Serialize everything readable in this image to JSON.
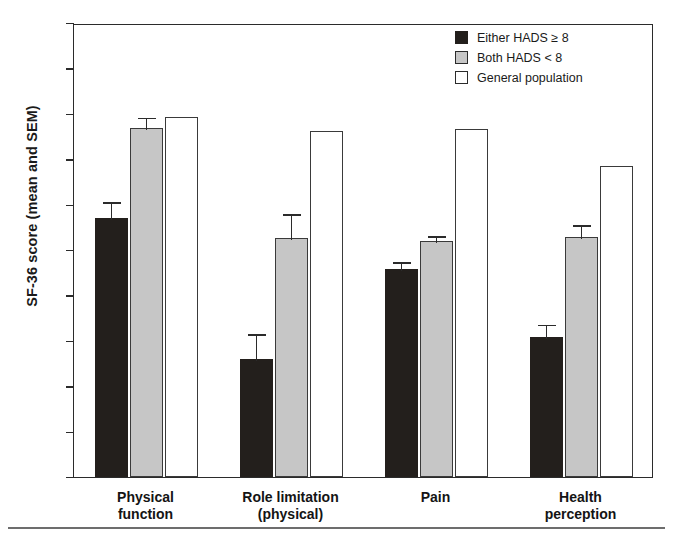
{
  "chart_data": {
    "type": "bar",
    "title": "",
    "xlabel": "",
    "ylabel": "SF-36 score (mean and SEM)",
    "ylim": [
      0,
      100
    ],
    "yticks": [
      0,
      10,
      20,
      30,
      40,
      50,
      60,
      70,
      80,
      90,
      100
    ],
    "grid": false,
    "legend_position": "top-right",
    "categories": [
      "Physical function",
      "Role limitation (physical)",
      "Pain",
      "Health perception"
    ],
    "category_lines": [
      [
        "Physical",
        "function"
      ],
      [
        "Role limitation",
        "(physical)"
      ],
      [
        "Pain",
        ""
      ],
      [
        "Health",
        "perception"
      ]
    ],
    "series": [
      {
        "name": "Either HADS ≥ 8",
        "key": "series-dark",
        "color": "#231f1c",
        "values": [
          57.0,
          26.0,
          45.8,
          30.8
        ],
        "sem": [
          4.0,
          6.0,
          2.0,
          3.2
        ]
      },
      {
        "name": "Both HADS < 8",
        "key": "series-gray",
        "color": "#c6c6c6",
        "values": [
          76.8,
          52.6,
          52.0,
          52.8
        ],
        "sem": [
          2.8,
          5.8,
          1.5,
          3.2
        ]
      },
      {
        "name": "General population",
        "key": "series-white",
        "color": "#ffffff",
        "values": [
          79.2,
          76.2,
          76.6,
          68.4
        ],
        "sem": [
          0,
          0,
          0,
          0
        ]
      }
    ]
  },
  "axis": {
    "y_title": "SF-36 score (mean and SEM)",
    "tick_labels": [
      "0",
      "10",
      "20",
      "30",
      "40",
      "50",
      "60",
      "70",
      "80",
      "90",
      "100"
    ]
  },
  "legend": {
    "items": [
      {
        "label": "Either HADS ≥ 8",
        "swatch": "series-dark"
      },
      {
        "label": "Both HADS < 8",
        "swatch": "series-gray"
      },
      {
        "label": "General population",
        "swatch": "series-white"
      }
    ]
  },
  "colors": {
    "dark": "#231f1c",
    "gray": "#c6c6c6",
    "white": "#ffffff",
    "axis": "#2b2b2b",
    "rule": "#6d6d6d"
  }
}
